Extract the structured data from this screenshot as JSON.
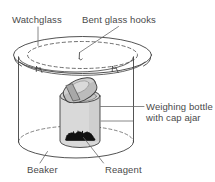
{
  "figure": {
    "labels": {
      "watchglass": "Watchglass",
      "bent_glass_hooks": "Bent glass hooks",
      "weighing_bottle_line1": "Weighing bottle",
      "weighing_bottle_line2": "with cap ajar",
      "beaker": "Beaker",
      "reagent": "Reagent"
    },
    "colors": {
      "stroke": "#3f3f3f",
      "label_text": "#4a4a4a",
      "bottle_fill": "#d9d9d9",
      "cap_fill": "#c9c9c9",
      "reagent": "#111111",
      "background": "#ffffff"
    },
    "parts": [
      "watchglass",
      "bent-glass-hooks",
      "beaker",
      "weighing-bottle",
      "weighing-bottle-cap",
      "reagent"
    ]
  }
}
